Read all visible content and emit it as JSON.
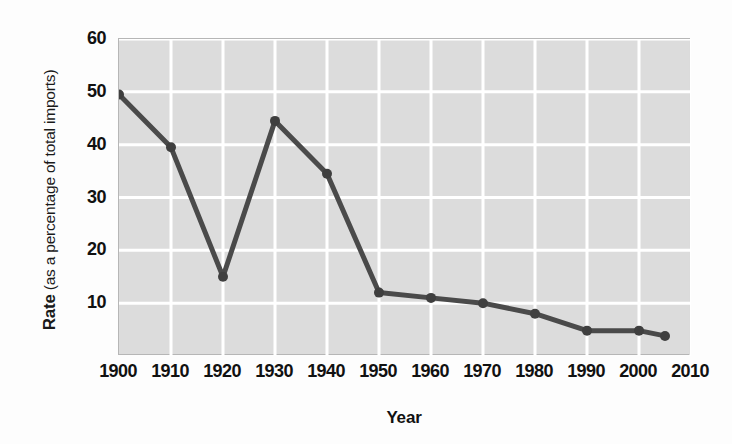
{
  "chart_data": {
    "type": "line",
    "title": "",
    "xlabel": "Year",
    "ylabel_strong": "Rate",
    "ylabel_rest": "(as a percentage of total imports)",
    "ylabel_full": "Rate (as a percentage of total imports)",
    "x": [
      1900,
      1910,
      1920,
      1930,
      1940,
      1950,
      1960,
      1970,
      1980,
      1990,
      2000,
      2005
    ],
    "values": [
      49.5,
      39.5,
      15,
      44.5,
      34.5,
      12,
      11,
      10,
      8,
      4.8,
      4.8,
      3.8
    ],
    "series": [
      {
        "name": "Rate",
        "values": [
          49.5,
          39.5,
          15,
          44.5,
          34.5,
          12,
          11,
          10,
          8,
          4.8,
          4.8,
          3.8
        ]
      }
    ],
    "xlim": [
      1900,
      2010
    ],
    "ylim": [
      0,
      60
    ],
    "xticks": [
      1900,
      1910,
      1920,
      1930,
      1940,
      1950,
      1960,
      1970,
      1980,
      1990,
      2000,
      2010
    ],
    "xticklabels": [
      "1900",
      "1910",
      "1920",
      "1930",
      "1940",
      "1950",
      "1960",
      "1970",
      "1980",
      "1990",
      "2000",
      "2010"
    ],
    "yticks": [
      10,
      20,
      30,
      40,
      50,
      60
    ],
    "yticklabels": [
      "10",
      "20",
      "30",
      "40",
      "50",
      "60"
    ],
    "grid": true,
    "legend": false,
    "colors": {
      "line": "#4a4a4a",
      "marker": "#3f3f3f",
      "plot_background": "#dcdcdc",
      "grid_line": "#ffffff",
      "plot_border": "#b6b6b6",
      "figure_background": "#fdfdfd",
      "text": "#111111"
    },
    "line_width": 5,
    "marker_radius": 5
  }
}
